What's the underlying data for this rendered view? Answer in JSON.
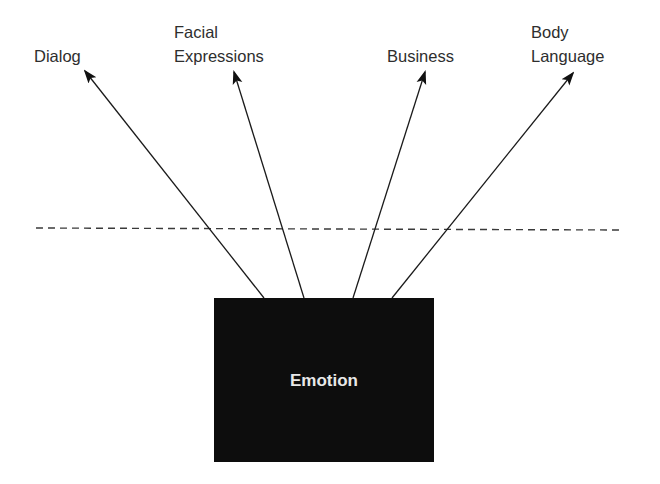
{
  "diagram": {
    "center": {
      "label": "Emotion",
      "box": {
        "x": 214,
        "y": 298,
        "width": 220,
        "height": 164
      },
      "fill": "#0d0d0d",
      "text_color": "#e8e8e8"
    },
    "separator": {
      "style": "dashed",
      "x1": 36,
      "y1": 228,
      "x2": 622,
      "y2": 230
    },
    "branches": [
      {
        "id": "dialog",
        "lines": [
          "Dialog"
        ],
        "label_x": 34,
        "from": [
          264,
          298
        ],
        "to": [
          85,
          71
        ]
      },
      {
        "id": "facial-expressions",
        "lines": [
          "Facial",
          "Expressions"
        ],
        "label_x": 174,
        "from": [
          304,
          298
        ],
        "to": [
          234,
          72
        ]
      },
      {
        "id": "business",
        "lines": [
          "Business"
        ],
        "label_x": 387,
        "from": [
          353,
          298
        ],
        "to": [
          425,
          72
        ]
      },
      {
        "id": "body-language",
        "lines": [
          "Body",
          "Language"
        ],
        "label_x": 531,
        "from": [
          392,
          298
        ],
        "to": [
          573,
          73
        ]
      }
    ],
    "text_color": "#2e2e2e",
    "line_color": "#1a1a1a"
  }
}
